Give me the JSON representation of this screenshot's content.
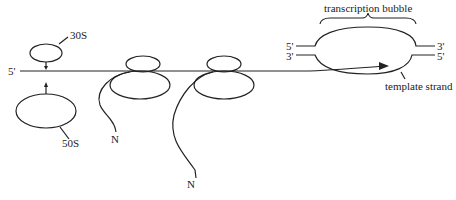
{
  "diagram": {
    "labels": {
      "subunit_small": "30S",
      "subunit_large": "50S",
      "mrna_five_prime": "5'",
      "nascent_chain_1": "N",
      "nascent_chain_2": "N",
      "bubble_title": "transcription bubble",
      "dna_top_left": "5'",
      "dna_bottom_left": "3'",
      "dna_top_right": "3'",
      "dna_bottom_right": "5'",
      "template_strand": "template strand"
    },
    "colors": {
      "line": "#222222",
      "background": "#ffffff"
    }
  }
}
